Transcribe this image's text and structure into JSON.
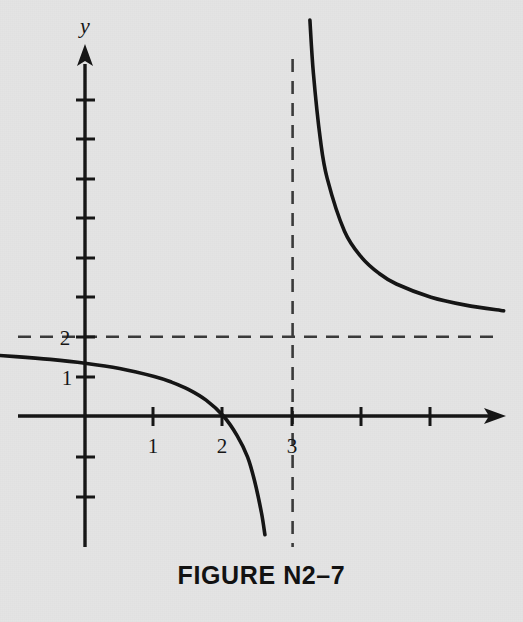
{
  "figure": {
    "caption": "FIGURE N2–7",
    "background_color": "#e4e4e4",
    "ink_color": "#151515",
    "dash_color": "#3a3a3a"
  },
  "chart_data": {
    "type": "line",
    "title": "FIGURE N2–7",
    "function": "y = 2(x - 2)/(x - 3)",
    "xlabel": "",
    "ylabel": "y",
    "x_axis_name": "",
    "y_axis_name": "y",
    "xlim": [
      -1.25,
      6.1
    ],
    "ylim": [
      -2.6,
      9.1
    ],
    "grid": false,
    "legend": false,
    "x_tick_values": [
      1,
      2,
      3,
      4,
      5
    ],
    "x_tick_labels": [
      "1",
      "2",
      "3",
      "",
      ""
    ],
    "y_tick_values": [
      -2,
      -1,
      1,
      2,
      3,
      4,
      5,
      6,
      7,
      8
    ],
    "y_tick_labels": [
      "",
      "",
      "1",
      "2",
      "",
      "",
      "",
      "",
      "",
      ""
    ],
    "annotations": [
      {
        "text": "y",
        "kind": "axis-name",
        "x": 0,
        "y": 9.0
      },
      {
        "text": "1",
        "kind": "x-tick-label",
        "x": 1,
        "y": 0
      },
      {
        "text": "2",
        "kind": "x-tick-label",
        "x": 2,
        "y": 0
      },
      {
        "text": "3",
        "kind": "x-tick-label",
        "x": 3,
        "y": 0
      },
      {
        "text": "1",
        "kind": "y-tick-label",
        "x": 0,
        "y": 1
      },
      {
        "text": "2",
        "kind": "y-tick-label",
        "x": 0,
        "y": 2
      }
    ],
    "asymptotes": [
      {
        "name": "vertical-asymptote",
        "type": "vertical",
        "value": 3,
        "label": "x = 3",
        "style": "dashed"
      },
      {
        "name": "horizontal-asymptote",
        "type": "horizontal",
        "value": 2,
        "label": "y = 2",
        "style": "dashed"
      }
    ],
    "intercepts": [
      {
        "name": "x-intercept",
        "x": 2,
        "y": 0
      },
      {
        "name": "y-intercept",
        "x": 0,
        "y": 1.333
      }
    ],
    "series": [
      {
        "name": "left-branch",
        "x_range": [
          -1.7,
          2.6
        ],
        "points": [
          [
            -1.7,
            1.574
          ],
          [
            -1.5,
            1.556
          ],
          [
            -1.0,
            1.5
          ],
          [
            -0.5,
            1.429
          ],
          [
            0.0,
            1.333
          ],
          [
            0.5,
            1.2
          ],
          [
            1.0,
            1.0
          ],
          [
            1.25,
            0.857
          ],
          [
            1.5,
            0.667
          ],
          [
            1.75,
            0.4
          ],
          [
            2.0,
            0.0
          ],
          [
            2.2,
            -0.5
          ],
          [
            2.35,
            -1.038
          ],
          [
            2.45,
            -1.636
          ],
          [
            2.55,
            -2.444
          ],
          [
            2.6,
            -3.0
          ]
        ]
      },
      {
        "name": "right-branch",
        "x_range": [
          3.25,
          6.05
        ],
        "points": [
          [
            3.25,
            10.0
          ],
          [
            3.3,
            8.667
          ],
          [
            3.4,
            7.0
          ],
          [
            3.5,
            6.0
          ],
          [
            3.75,
            4.667
          ],
          [
            4.0,
            4.0
          ],
          [
            4.25,
            3.6
          ],
          [
            4.5,
            3.333
          ],
          [
            5.0,
            3.0
          ],
          [
            5.5,
            2.8
          ],
          [
            6.05,
            2.656
          ]
        ]
      }
    ]
  }
}
